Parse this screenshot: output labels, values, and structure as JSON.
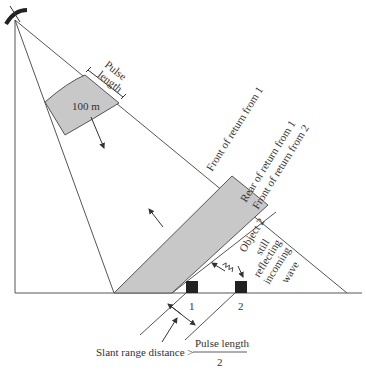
{
  "diagram": {
    "pulse_label_line1": "Pulse",
    "pulse_label_line2": "length",
    "pulse_distance": "100 m",
    "front_return_1": "Front of return from 1",
    "rear_return_1": "Rear of return from 1",
    "front_return_2": "Front of return from 2",
    "object2_line1": "Object 2",
    "object2_line2": "still",
    "object2_line3": "reflecting",
    "object2_line4": "incoming",
    "object2_line5": "wave",
    "object1_label": "1",
    "object2_label": "2",
    "formula_prefix": "Slant range distance >",
    "formula_numerator": "Pulse length",
    "formula_denominator": "2"
  },
  "colors": {
    "line": "#555555",
    "fill": "#c8c8c8",
    "object": "#222222",
    "text": "#333333"
  }
}
